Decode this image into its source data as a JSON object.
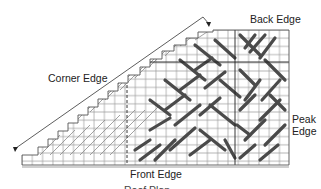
{
  "diagram": {
    "labels": {
      "back_edge": "Back Edge",
      "corner_edge": "Corner Edge",
      "peak_edge_line1": "Peak",
      "peak_edge_line2": "Edge",
      "front_edge": "Front Edge",
      "caption_partial": "Roof Plan...."
    },
    "colors": {
      "grid": "#9a9a9a",
      "stroke_dark": "#4a4a4a",
      "line": "#333333",
      "background": "#ffffff"
    },
    "grid": {
      "cell_size": 10.3,
      "columns": 26,
      "rows": 13
    }
  }
}
